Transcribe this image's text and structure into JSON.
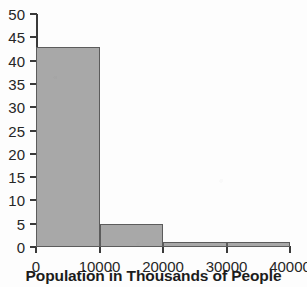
{
  "chart_data": {
    "type": "bar",
    "title": "",
    "subtitle": "",
    "xlabel": "Population in Thousands of People",
    "ylabel": "",
    "categories": [
      "0-10000",
      "10000-20000",
      "20000-30000",
      "30000-40000"
    ],
    "values": [
      43,
      5,
      1,
      1
    ],
    "bin_edges": [
      0,
      10000,
      20000,
      30000,
      40000
    ],
    "bin_width": 10000,
    "xlim": [
      0,
      40000
    ],
    "ylim": [
      0,
      50
    ],
    "x_ticks": [
      0,
      10000,
      20000,
      30000,
      40000
    ],
    "x_tick_labels": [
      "0",
      "10000",
      "20000",
      "30000",
      "40000"
    ],
    "y_ticks": [
      0,
      5,
      10,
      15,
      20,
      25,
      30,
      35,
      40,
      45,
      50
    ],
    "y_tick_labels": [
      "0",
      "5",
      "10",
      "15",
      "20",
      "25",
      "30",
      "35",
      "40",
      "45",
      "50"
    ],
    "grid": false,
    "legend": false,
    "legend_position": "none",
    "bar_fill_color": "#a8a8a8",
    "bar_edge_color": "#5c5c5c",
    "axis_color": "#3a3a3a",
    "background_color": "#fdfdfd",
    "text_color": "#262626"
  }
}
